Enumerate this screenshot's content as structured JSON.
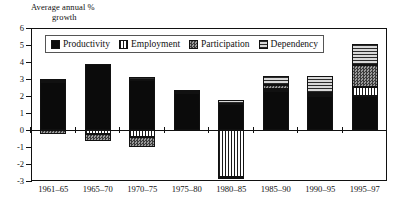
{
  "chart_data": {
    "type": "bar",
    "title": "",
    "subtitle": "",
    "ylabel_line1": "Average annual %",
    "ylabel_line2": "growth",
    "xlabel": "",
    "grid": false,
    "stacked": true,
    "legend_position": "top-inside",
    "ylim": [
      -3,
      6
    ],
    "yticks": [
      6,
      5,
      4,
      3,
      2,
      1,
      0,
      -1,
      -2,
      -3
    ],
    "ytick_labels": [
      "6",
      "5",
      "4",
      "3",
      "2",
      "1",
      "0",
      "-1",
      "-2",
      "-3"
    ],
    "categories": [
      "1961–65",
      "1965–70",
      "1970–75",
      "1975–80",
      "1980–85",
      "1985–90",
      "1990–95",
      "1995–97"
    ],
    "series": [
      {
        "name": "Productivity",
        "key": "productivity",
        "color": "#0b0b0b",
        "pattern": "solid",
        "values": [
          2.85,
          3.9,
          2.95,
          2.2,
          1.55,
          2.3,
          2.0,
          2.0
        ]
      },
      {
        "name": "Employment",
        "key": "employment",
        "color": "#1a1a1a",
        "pattern": "vertical-stripes",
        "values": [
          0.05,
          -0.25,
          -0.4,
          0.05,
          -2.75,
          0.1,
          0.05,
          0.55
        ]
      },
      {
        "name": "Participation",
        "key": "participation",
        "color": "#3a3a3a",
        "pattern": "checker",
        "values": [
          -0.25,
          -0.4,
          -0.6,
          0.0,
          -0.15,
          0.25,
          0.15,
          1.3
        ]
      },
      {
        "name": "Dependency",
        "key": "dependency",
        "color": "#2b2b2b",
        "pattern": "horizontal-stripes",
        "values": [
          0.1,
          0.0,
          0.15,
          0.1,
          0.2,
          0.55,
          1.0,
          1.2
        ]
      }
    ]
  },
  "legend": {
    "items": [
      {
        "label": "Productivity",
        "swatch": "productivity-swatch"
      },
      {
        "label": "Employment",
        "swatch": "employment-swatch"
      },
      {
        "label": "Participation",
        "swatch": "participation-swatch"
      },
      {
        "label": "Dependency",
        "swatch": "dependency-swatch"
      }
    ]
  }
}
